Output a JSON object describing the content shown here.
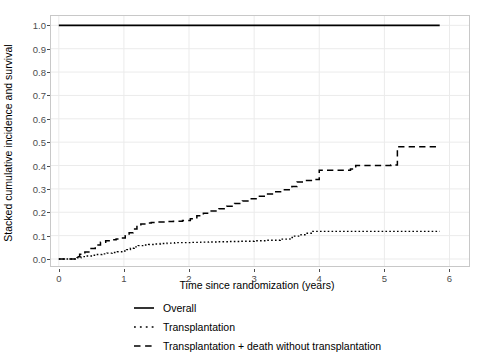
{
  "chart_data": {
    "type": "line",
    "title": "",
    "subtitle": "",
    "xlabel": "Time since randomization (years)",
    "ylabel": "Stacked cumulative incidence and survival",
    "xlim": [
      -0.12,
      6.3
    ],
    "ylim": [
      -0.03,
      1.04
    ],
    "xticks": [
      0,
      1,
      2,
      3,
      4,
      5,
      6
    ],
    "xtick_labels": [
      "0",
      "1",
      "2",
      "3",
      "4",
      "5",
      "6"
    ],
    "yticks": [
      0.0,
      0.1,
      0.2,
      0.3,
      0.4,
      0.5,
      0.6,
      0.7,
      0.8,
      0.9,
      1.0
    ],
    "ytick_labels": [
      "0.0",
      "0.1",
      "0.2",
      "0.3",
      "0.4",
      "0.5",
      "0.6",
      "0.7",
      "0.8",
      "0.9",
      "1.0"
    ],
    "grid": true,
    "grid_color": "#ebebeb",
    "panel_border_color": "#c8c8c8",
    "background": "#ffffff",
    "legend_position": "bottom",
    "step_type": "post",
    "series": [
      {
        "name": "Overall",
        "linestyle": "solid",
        "color": "#000000",
        "linewidth": 1.6,
        "x": [
          0.0,
          5.85
        ],
        "y": [
          1.0,
          1.0
        ]
      },
      {
        "name": "Transplantation",
        "linestyle": "dotted",
        "color": "#000000",
        "linewidth": 1.4,
        "x": [
          0.0,
          0.28,
          0.34,
          0.42,
          0.5,
          0.58,
          0.66,
          0.74,
          0.82,
          0.9,
          0.98,
          1.04,
          1.1,
          1.16,
          1.22,
          1.3,
          1.38,
          1.46,
          1.56,
          1.66,
          1.78,
          1.92,
          2.05,
          2.18,
          2.3,
          2.45,
          2.62,
          2.8,
          3.0,
          3.2,
          3.4,
          3.55,
          3.62,
          3.72,
          3.8,
          3.9,
          5.85
        ],
        "y": [
          0.0,
          0.005,
          0.01,
          0.013,
          0.016,
          0.019,
          0.022,
          0.025,
          0.028,
          0.031,
          0.034,
          0.04,
          0.046,
          0.052,
          0.057,
          0.06,
          0.062,
          0.064,
          0.066,
          0.068,
          0.07,
          0.07,
          0.071,
          0.072,
          0.073,
          0.074,
          0.075,
          0.076,
          0.078,
          0.08,
          0.085,
          0.092,
          0.098,
          0.104,
          0.11,
          0.118,
          0.118
        ]
      },
      {
        "name": "Transplantation + death without transplantation",
        "linestyle": "dashed",
        "color": "#000000",
        "linewidth": 1.5,
        "x": [
          0.0,
          0.26,
          0.32,
          0.4,
          0.48,
          0.56,
          0.64,
          0.72,
          0.8,
          0.88,
          0.96,
          1.02,
          1.08,
          1.14,
          1.2,
          1.26,
          1.34,
          1.42,
          1.52,
          1.64,
          1.76,
          1.9,
          2.02,
          2.12,
          2.22,
          2.34,
          2.46,
          2.58,
          2.7,
          2.82,
          2.94,
          3.06,
          3.18,
          3.3,
          3.44,
          3.58,
          3.66,
          3.78,
          3.9,
          4.0,
          4.48,
          4.56,
          5.1,
          5.2,
          5.85
        ],
        "y": [
          0.0,
          0.01,
          0.02,
          0.03,
          0.045,
          0.06,
          0.072,
          0.078,
          0.082,
          0.086,
          0.09,
          0.1,
          0.112,
          0.128,
          0.142,
          0.15,
          0.154,
          0.156,
          0.158,
          0.16,
          0.162,
          0.165,
          0.172,
          0.185,
          0.196,
          0.205,
          0.215,
          0.226,
          0.238,
          0.248,
          0.258,
          0.268,
          0.278,
          0.288,
          0.296,
          0.31,
          0.33,
          0.336,
          0.34,
          0.38,
          0.385,
          0.4,
          0.402,
          0.48,
          0.48
        ]
      }
    ]
  },
  "legend": {
    "items": [
      {
        "label": "Overall",
        "style": "solid"
      },
      {
        "label": "Transplantation",
        "style": "dotted"
      },
      {
        "label": "Transplantation + death without transplantation",
        "style": "dashed"
      }
    ]
  }
}
